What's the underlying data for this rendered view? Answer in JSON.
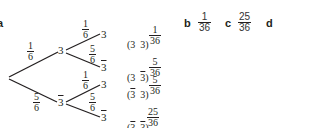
{
  "parts": {
    "a": {
      "label": "a"
    },
    "b": {
      "label": "b",
      "answer": {
        "num": "1",
        "den": "36"
      }
    },
    "c": {
      "label": "c",
      "answer": {
        "num": "25",
        "den": "36"
      }
    },
    "d": {
      "label": "d"
    }
  },
  "tree": {
    "level1": [
      {
        "node": "3",
        "barred": false,
        "prob": {
          "num": "1",
          "den": "6"
        }
      },
      {
        "node": "3",
        "barred": true,
        "prob": {
          "num": "5",
          "den": "6"
        }
      }
    ],
    "level2": [
      {
        "node": "3",
        "barred": false,
        "prob": {
          "num": "1",
          "den": "6"
        },
        "outcome_a": "3",
        "a_bar": false,
        "outcome_b": "3",
        "b_bar": false,
        "result": {
          "num": "1",
          "den": "36"
        }
      },
      {
        "node": "3",
        "barred": true,
        "prob": {
          "num": "5",
          "den": "6"
        },
        "outcome_a": "3",
        "a_bar": false,
        "outcome_b": "3",
        "b_bar": true,
        "result": {
          "num": "5",
          "den": "36"
        }
      },
      {
        "node": "3",
        "barred": false,
        "prob": {
          "num": "1",
          "den": "6"
        },
        "outcome_a": "3",
        "a_bar": true,
        "outcome_b": "3",
        "b_bar": false,
        "result": {
          "num": "5",
          "den": "36"
        }
      },
      {
        "node": "3",
        "barred": true,
        "prob": {
          "num": "5",
          "den": "6"
        },
        "outcome_a": "3",
        "a_bar": true,
        "outcome_b": "3",
        "b_bar": true,
        "result": {
          "num": "25",
          "den": "36"
        }
      }
    ]
  },
  "punct": {
    "open": "(",
    "close": ")"
  }
}
